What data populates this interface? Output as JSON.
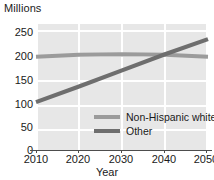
{
  "chart_data": {
    "type": "line",
    "title": "",
    "ylabel": "Millions",
    "xlabel": "Year",
    "x": [
      2010,
      2020,
      2030,
      2040,
      2050
    ],
    "xlim": [
      2010,
      2050
    ],
    "ylim": [
      0,
      250
    ],
    "yticks": [
      250,
      200,
      150,
      100,
      50,
      0
    ],
    "xticks": [
      "2010",
      "2020",
      "2030",
      "2040",
      "2050"
    ],
    "grid": true,
    "legend_position": "inside-lower-right",
    "series": [
      {
        "name": "Non-Hispanic white",
        "color": "#9b9b9b",
        "values": [
          185,
          189,
          190,
          189,
          185
        ]
      },
      {
        "name": "Other",
        "color": "#6e6e6e",
        "values": [
          95,
          126,
          158,
          190,
          220
        ]
      }
    ]
  },
  "axes": {
    "y_title": "Millions",
    "x_title": "Year",
    "y_tick_labels": [
      "250",
      "200",
      "150",
      "100",
      "50",
      "0"
    ],
    "x_tick_labels": [
      "2010",
      "2020",
      "2030",
      "2040",
      "2050"
    ]
  },
  "legend": {
    "items": [
      {
        "label": "Non-Hispanic white",
        "color": "#9b9b9b"
      },
      {
        "label": "Other",
        "color": "#6e6e6e"
      }
    ]
  },
  "colors": {
    "plot_background": "#e7e7e7",
    "gridline": "#ffffff",
    "axis": "#4d4d4d",
    "text": "#1a1a1a",
    "series_non_hispanic_white": "#9b9b9b",
    "series_other": "#6e6e6e"
  }
}
